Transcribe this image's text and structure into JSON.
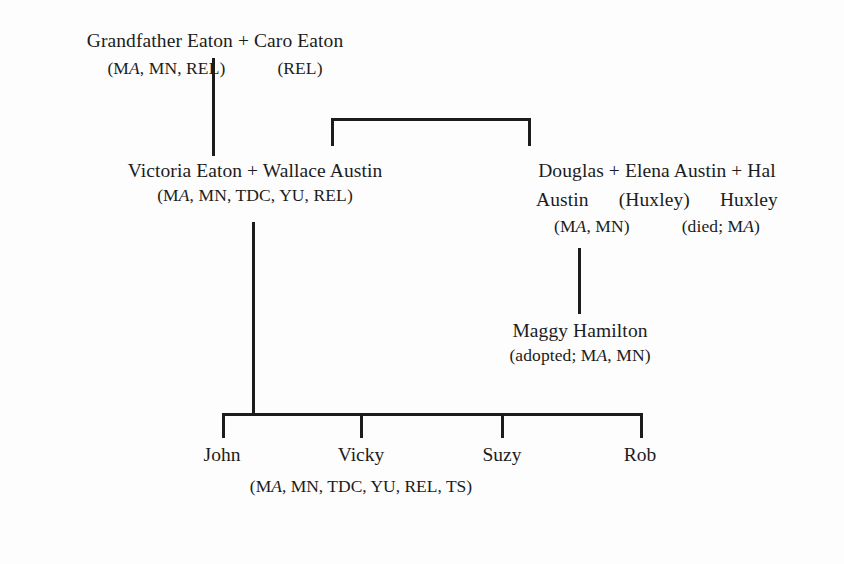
{
  "diagram": {
    "generations": {
      "grandparents": {
        "names": "Grandfather Eaton + Caro Eaton",
        "codes_left": "(MA, MN, REL)",
        "codes_right": "(REL)"
      },
      "victoria": {
        "names": "Victoria Eaton + Wallace Austin",
        "codes": "(MA, MN, TDC, YU, REL)"
      },
      "austin_huxley": {
        "line1": "Douglas + Elena Austin + Hal",
        "line2_left": "Austin",
        "line2_mid": "(Huxley)",
        "line2_right": "Huxley",
        "line3_left": "(MA, MN)",
        "line3_right": "(died; MA)"
      },
      "maggy": {
        "name": "Maggy Hamilton",
        "codes": "(adopted; MA, MN)"
      },
      "children": {
        "items": [
          {
            "name": "John"
          },
          {
            "name": "Vicky"
          },
          {
            "name": "Suzy"
          },
          {
            "name": "Rob"
          }
        ],
        "codes": "(MA, MN, TDC, YU, REL, TS)"
      }
    },
    "ink_color": "#1c1c1c",
    "background_color": "#fdfdfd"
  }
}
